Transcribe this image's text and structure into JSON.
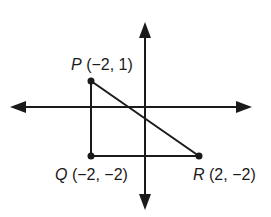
{
  "diagram": {
    "type": "coordinate-plane-triangle",
    "points": [
      {
        "name": "P",
        "coords": "(−2, 1)",
        "x": -2,
        "y": 1
      },
      {
        "name": "Q",
        "coords": "(−2, −2)",
        "x": -2,
        "y": -2
      },
      {
        "name": "R",
        "coords": "(2, −2)",
        "x": 2,
        "y": -2
      }
    ],
    "labels": {
      "p_name": "P",
      "p_coords": "(−2, 1)",
      "q_name": "Q",
      "q_coords": "(−2, −2)",
      "r_name": "R",
      "r_coords": "(2, −2)"
    },
    "colors": {
      "stroke": "#1a1a1a",
      "background": "#ffffff"
    }
  }
}
